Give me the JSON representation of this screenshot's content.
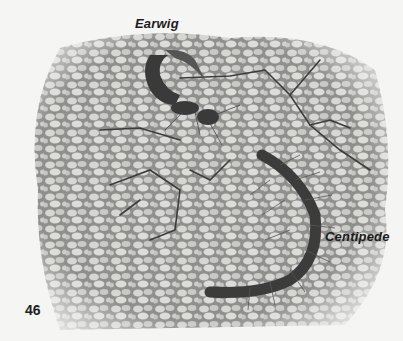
{
  "page": {
    "page_number": "46",
    "illustration": {
      "description": "Earwig and centipede on cracked, cobbled soil surface",
      "style": "monochrome pencil illustration"
    },
    "labels": {
      "earwig": "Earwig",
      "centipede": "Centipede"
    }
  },
  "colors": {
    "background": "#f5f5f3",
    "soil_light": "#cfcfcc",
    "soil_mid": "#9a9a98",
    "soil_dark": "#4a4a48",
    "creature_dark": "#3a3a3a",
    "text": "#1b1b1b"
  }
}
